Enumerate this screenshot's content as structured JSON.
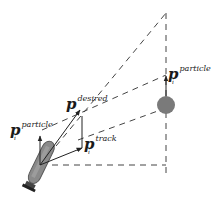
{
  "diagram": {
    "colors": {
      "line": "#222222",
      "dash": "#333333",
      "robot_body": "#8a8a8a",
      "robot_edge": "#555555",
      "target": "#7a7a7a"
    },
    "labels": {
      "particle_left": {
        "symbol": "p",
        "superscript": "particle",
        "subscript": "i"
      },
      "desired": {
        "symbol": "p",
        "superscript": "desired",
        "subscript": ""
      },
      "track": {
        "symbol": "p",
        "superscript": "track",
        "subscript": "i"
      },
      "particle_right": {
        "symbol": "p",
        "superscript": "particle",
        "subscript": "i"
      }
    },
    "elements": {
      "robot": "robot-body-icon",
      "target": "target-circle-icon"
    }
  }
}
